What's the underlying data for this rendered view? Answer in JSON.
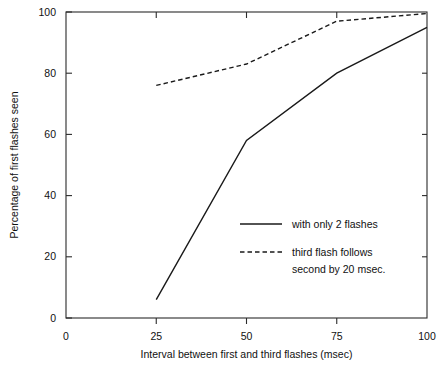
{
  "chart_data": {
    "type": "line",
    "title": "",
    "xlabel": "Interval between first and third flashes (msec)",
    "ylabel": "Percentage of first flashes seen",
    "xlim": [
      0,
      100
    ],
    "ylim": [
      0,
      100
    ],
    "xticks": [
      0,
      25,
      50,
      75,
      100
    ],
    "xtick_labels": [
      "0",
      "25",
      "50",
      "75",
      "100"
    ],
    "yticks": [
      0,
      20,
      40,
      60,
      80,
      100
    ],
    "ytick_labels": [
      "0",
      "20",
      "40",
      "60",
      "80",
      "100"
    ],
    "grid": false,
    "legend_position": "center-right",
    "x": [
      25,
      50,
      75,
      100
    ],
    "series": [
      {
        "name": "with only 2 flashes",
        "style": "solid",
        "values": [
          6,
          58,
          80,
          95
        ]
      },
      {
        "name": "third flash follows second by 20 msec.",
        "style": "dashed",
        "values": [
          76,
          83,
          97,
          99.5
        ]
      }
    ]
  },
  "legend": {
    "entries": [
      {
        "label": "with only 2 flashes",
        "style": "solid"
      },
      {
        "label_line1": "third flash follows",
        "label_line2": "second by 20 msec.",
        "style": "dashed"
      }
    ]
  },
  "colors": {
    "background": "#ffffff",
    "axis": "#2b2b2b",
    "series": "#1a1a1a"
  }
}
